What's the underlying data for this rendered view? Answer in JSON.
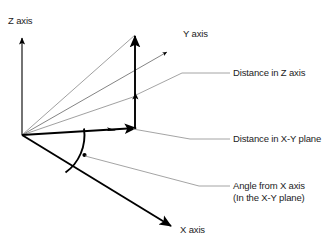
{
  "diagram": {
    "background_color": "#ffffff",
    "stroke_color": "#000000",
    "leader_color": "#8c8c8c",
    "thin_line_color": "#9a9a9a",
    "axes": [
      {
        "key": "z",
        "label": "Z axis"
      },
      {
        "key": "y",
        "label": "Y axis"
      },
      {
        "key": "x",
        "label": "X axis"
      }
    ],
    "callouts": [
      {
        "key": "z_distance",
        "label": "Distance in Z axis",
        "sub": ""
      },
      {
        "key": "xy_distance",
        "label": "Distance in X-Y plane",
        "sub": ""
      },
      {
        "key": "angle",
        "label": "Angle from X axis",
        "sub": "(In the X-Y plane)"
      }
    ],
    "labels": {
      "z_axis": "Z axis",
      "y_axis": "Y axis",
      "x_axis": "X axis",
      "distance_z": "Distance in Z axis",
      "distance_xy": "Distance in X-Y plane",
      "angle_from_x": "Angle from X axis",
      "angle_plane_note": "(In the X-Y plane)"
    }
  }
}
